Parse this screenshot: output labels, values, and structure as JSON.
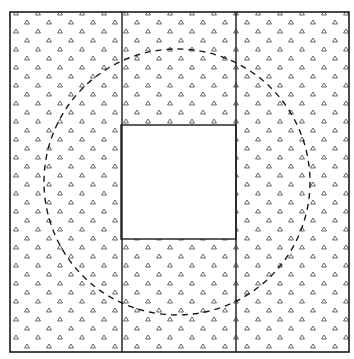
{
  "diagram": {
    "colors": {
      "background": "#ffffff",
      "stroke": "#1a1a1a",
      "pattern": "#555555"
    },
    "outer_square": {
      "x": 10,
      "y": 12,
      "width": 339,
      "height": 340
    },
    "column_dividers": [
      122,
      236
    ],
    "center_hole": {
      "x": 121,
      "y": 125,
      "width": 115,
      "height": 114
    },
    "dashed_circle": {
      "cx": 177,
      "cy": 182,
      "r": 133
    },
    "pattern": {
      "glyph": "triangle",
      "spacing_x": 11,
      "spacing_y": 9
    }
  }
}
